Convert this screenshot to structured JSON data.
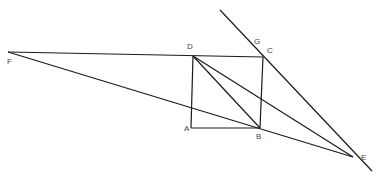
{
  "diagram": {
    "type": "geometry",
    "points": {
      "A": {
        "label": "A",
        "x": 191,
        "y": 128,
        "lx": 184,
        "ly": 131
      },
      "B": {
        "label": "B",
        "x": 260,
        "y": 128,
        "lx": 256,
        "ly": 139
      },
      "C": {
        "label": "C",
        "x": 263,
        "y": 57,
        "lx": 267,
        "ly": 53
      },
      "D": {
        "label": "D",
        "x": 193,
        "y": 56,
        "lx": 187,
        "ly": 49
      },
      "E": {
        "label": "E",
        "x": 353,
        "y": 157,
        "lx": 361,
        "ly": 160
      },
      "F": {
        "label": "F",
        "x": 8,
        "y": 52,
        "lx": 7,
        "ly": 64
      },
      "G": {
        "label": "G",
        "x": 254,
        "y": 44,
        "lx": 254,
        "ly": 44
      }
    },
    "segments": [
      [
        "F",
        "C"
      ],
      [
        "F",
        "E"
      ],
      [
        "D",
        "A"
      ],
      [
        "A",
        "B"
      ],
      [
        "B",
        "C"
      ],
      [
        "D",
        "B"
      ],
      [
        "D",
        "E"
      ],
      [
        "G-top",
        "E-ext"
      ]
    ],
    "line_color": "#1a1a1a",
    "label_color": "#444444"
  }
}
